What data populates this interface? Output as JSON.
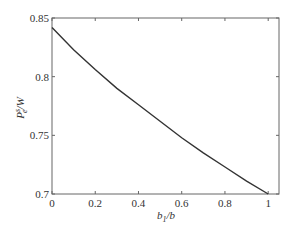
{
  "chart_data": {
    "type": "line",
    "title": "",
    "xlabel": "b1/b",
    "ylabel": "Pe^s/W",
    "xlim": [
      0,
      1.05
    ],
    "ylim": [
      0.7,
      0.85
    ],
    "grid": false,
    "legend": null,
    "x_ticks": [
      "0",
      "0.2",
      "0.4",
      "0.6",
      "0.8",
      "1"
    ],
    "y_ticks": [
      "0.7",
      "0.75",
      "0.8",
      "0.85"
    ],
    "series": [
      {
        "name": "Pe^s/W",
        "color": "#333333",
        "x": [
          0,
          0.1,
          0.2,
          0.3,
          0.4,
          0.5,
          0.6,
          0.7,
          0.8,
          0.9,
          1.0
        ],
        "values": [
          0.842,
          0.823,
          0.806,
          0.79,
          0.776,
          0.762,
          0.748,
          0.735,
          0.723,
          0.711,
          0.7
        ]
      }
    ]
  },
  "labels": {
    "xlabel_main": "b",
    "xlabel_sub": "1",
    "xlabel_tail": "/b",
    "ylabel_main": "P",
    "ylabel_sub": "e",
    "ylabel_sup": "s",
    "ylabel_tail": "/W"
  }
}
